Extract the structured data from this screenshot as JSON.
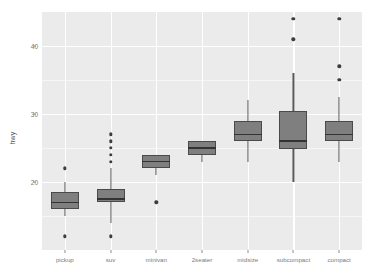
{
  "chart": {
    "type": "boxplot",
    "y_axis_title": "hwy",
    "x_axis_title": "",
    "title": "",
    "background": "#ebebeb",
    "gridline_color": "#ffffff",
    "box_fill": "#7f7f7f",
    "box_outline": "#4a4a4a",
    "median_color": "#333333",
    "outlier_color": "#3d3d3d",
    "ylim": [
      10,
      45
    ],
    "ytick_labels": [
      "20",
      "30",
      "40"
    ],
    "ytick_values": [
      20,
      30,
      40
    ],
    "grid": true,
    "legend": "none"
  },
  "chart_data": {
    "type": "boxplot",
    "title": "",
    "xlabel": "",
    "ylabel": "hwy",
    "ylim": [
      10,
      45
    ],
    "grid": true,
    "legend_position": "none",
    "categories": [
      "pickup",
      "suv",
      "minivan",
      "2seater",
      "midsize",
      "subcompact",
      "compact"
    ],
    "boxes": [
      {
        "category": "pickup",
        "min_whisker": 15.0,
        "q1": 16.0,
        "median": 17.0,
        "q3": 18.5,
        "max_whisker": 20.0,
        "outliers": [
          22.0,
          12.0
        ]
      },
      {
        "category": "suv",
        "min_whisker": 14.0,
        "q1": 17.0,
        "median": 17.5,
        "q3": 19.0,
        "max_whisker": 22.0,
        "outliers": [
          27.0,
          26.0,
          25.0,
          24.0,
          23.0,
          12.0
        ]
      },
      {
        "category": "minivan",
        "min_whisker": 21.0,
        "q1": 22.0,
        "median": 23.0,
        "q3": 24.0,
        "max_whisker": 24.0,
        "outliers": [
          17.0
        ]
      },
      {
        "category": "2seater",
        "min_whisker": 23.0,
        "q1": 24.0,
        "median": 25.0,
        "q3": 26.0,
        "max_whisker": 26.0,
        "outliers": []
      },
      {
        "category": "midsize",
        "min_whisker": 23.0,
        "q1": 26.0,
        "median": 27.0,
        "q3": 29.0,
        "max_whisker": 32.0,
        "outliers": []
      },
      {
        "category": "subcompact",
        "min_whisker": 20.0,
        "q1": 24.8,
        "median": 26.0,
        "q3": 30.5,
        "max_whisker": 36.0,
        "outliers": [
          44.0,
          41.0
        ]
      },
      {
        "category": "compact",
        "min_whisker": 23.0,
        "q1": 26.0,
        "median": 27.0,
        "q3": 29.0,
        "max_whisker": 32.5,
        "outliers": [
          44.0,
          37.0,
          35.0
        ]
      }
    ]
  }
}
